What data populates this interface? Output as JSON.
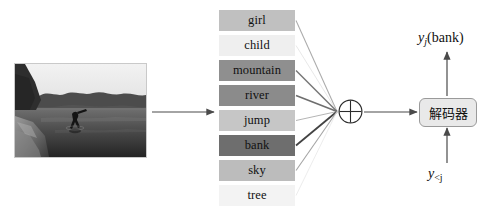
{
  "diagram": {
    "source_image": {
      "name": "river-jump-photo",
      "description": "grayscale photo of a person jumping from a bank into a river",
      "alt": "person jumping into river from bank"
    },
    "attention_heading": "",
    "words": [
      {
        "label": "girl",
        "weight": 0.3,
        "color": "#c0c0c0"
      },
      {
        "label": "child",
        "weight": 0.06,
        "color": "#efefef"
      },
      {
        "label": "mountain",
        "weight": 0.55,
        "color": "#8f8f8f"
      },
      {
        "label": "river",
        "weight": 0.58,
        "color": "#8b8b8b"
      },
      {
        "label": "jump",
        "weight": 0.26,
        "color": "#c6c6c6"
      },
      {
        "label": "bank",
        "weight": 0.78,
        "color": "#6e6e6e"
      },
      {
        "label": "sky",
        "weight": 0.33,
        "color": "#bcbcbc"
      },
      {
        "label": "tree",
        "weight": 0.04,
        "color": "#f3f3f3"
      }
    ],
    "sum_node": {
      "name": "circle-plus",
      "glyph": "+"
    },
    "decoder": {
      "label": "解码器"
    },
    "output_label": {
      "y": "y",
      "sub": "j",
      "word": "(bank)"
    },
    "prev_label": {
      "y": "y",
      "sub": "<j"
    },
    "colors": {
      "arrow": "#4a4a4a",
      "box_border": "#9a9a9a",
      "decoder_fill": "#e9e9e9",
      "background": "#ffffff"
    }
  }
}
